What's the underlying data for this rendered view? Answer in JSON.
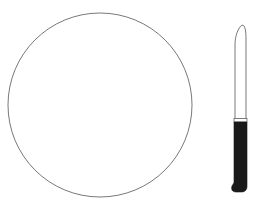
{
  "scene": {
    "description": "Line drawing of a round plate with a table knife to its right",
    "background_color": "#ffffff",
    "line_color": "#555555",
    "handle_color": "#1a1a1a"
  },
  "plate": {
    "label": "plate",
    "shape": "circle",
    "center": [
      100,
      105
    ],
    "radius": 92
  },
  "knife": {
    "label": "knife",
    "orientation": "vertical",
    "blade_top_y": 25,
    "bolster_y": 119,
    "handle_bottom_y": 192
  }
}
